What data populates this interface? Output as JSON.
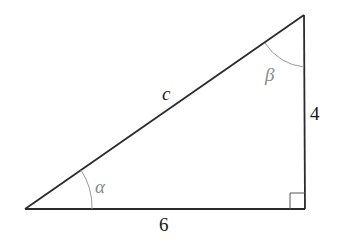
{
  "diagram": {
    "type": "right-triangle",
    "vertices": {
      "bottom_left": [
        25,
        209
      ],
      "bottom_right": [
        305,
        209
      ],
      "top_right": [
        304,
        15
      ]
    },
    "sides": {
      "hypotenuse": {
        "label": "c"
      },
      "base": {
        "label": "6"
      },
      "height": {
        "label": "4"
      }
    },
    "angles": {
      "alpha": {
        "label": "α",
        "vertex": "bottom_left"
      },
      "beta": {
        "label": "β",
        "vertex": "top_right"
      },
      "right_angle": {
        "vertex": "bottom_right"
      }
    },
    "colors": {
      "stroke": "#2b2b2b",
      "angle_arc": "#9a9a9a",
      "angle_label": "#8a8a8a",
      "side_label": "#1a1a1a",
      "background": "#ffffff"
    }
  }
}
